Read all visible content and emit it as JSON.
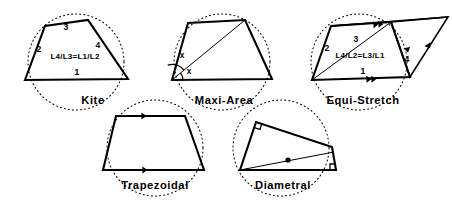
{
  "figure": {
    "background_color": "#ffffff",
    "stroke_color": "#000000",
    "width": 452,
    "height": 223,
    "shape_count": 5
  },
  "shapes": [
    {
      "id": "kite",
      "caption": "Kite",
      "caption_x": 93,
      "caption_y": 104,
      "circle": {
        "cx": 76,
        "cy": 62,
        "r": 48
      },
      "polygon": "25,80 45,26 88,20 128,79",
      "ratio_label": {
        "text": "L4/L3=L1/L2",
        "x": 75,
        "y": 59
      },
      "edge_labels": [
        {
          "text": "1",
          "x": 77,
          "y": 75
        },
        {
          "text": "2",
          "x": 39,
          "y": 52
        },
        {
          "text": "3",
          "x": 66,
          "y": 30
        },
        {
          "text": "4",
          "x": 98,
          "y": 48
        }
      ]
    },
    {
      "id": "maxi-area",
      "caption": "Maxi-Area",
      "caption_x": 224,
      "caption_y": 104,
      "circle": {
        "cx": 222,
        "cy": 62,
        "r": 48
      },
      "polygon": "172,80 188,23 245,20 272,79",
      "diagonal": {
        "x1": 172,
        "y1": 80,
        "x2": 245,
        "y2": 20
      },
      "angle_labels": [
        {
          "text": "x",
          "x": 182,
          "y": 58
        },
        {
          "text": "x",
          "x": 189,
          "y": 74
        }
      ],
      "angle_arcs": [
        {
          "cx": 172,
          "cy": 80,
          "r": 15.5,
          "start_deg": 254,
          "end_deg": 320
        },
        {
          "cx": 172,
          "cy": 80,
          "r": 11.0,
          "start_deg": 320,
          "end_deg": 359
        }
      ]
    },
    {
      "id": "equi-stretch",
      "caption": "Equi-Stretch",
      "caption_x": 363,
      "caption_y": 104,
      "circle": {
        "cx": 359,
        "cy": 62,
        "r": 48
      },
      "polygon": "312,80 331,26 391,22 410,77",
      "extra_polygon": "391,22 448,17 410,77",
      "bridge_line": {
        "x1": 331,
        "y1": 26,
        "x2": 448,
        "y2": 17
      },
      "diagonal": {
        "x1": 312,
        "y1": 80,
        "x2": 391,
        "y2": 22
      },
      "ratio_label": {
        "text": "L4/L2=L3/L1",
        "x": 360,
        "y": 58
      },
      "edge_labels": [
        {
          "text": "1",
          "x": 363,
          "y": 74
        },
        {
          "text": "2",
          "x": 327,
          "y": 51
        },
        {
          "text": "3",
          "x": 356,
          "y": 42
        },
        {
          "text": "4",
          "x": 407,
          "y": 62
        }
      ],
      "double_tick_edges": [
        {
          "x": 378,
          "y": 24.3,
          "angle": -4.4
        },
        {
          "x": 371,
          "y": 79.2,
          "angle": -2.0
        }
      ],
      "single_tick_edges": [
        {
          "x": 408,
          "y": 52,
          "angle": 75
        },
        {
          "x": 430,
          "y": 48,
          "angle": 56
        }
      ]
    },
    {
      "id": "trapezoidal",
      "caption": "Trapezoidal",
      "caption_x": 155,
      "caption_y": 189,
      "circle": {
        "cx": 155,
        "cy": 148,
        "r": 48
      },
      "polygon": "103,170 116,116 185,116 204,170",
      "single_tick_edges": [
        {
          "x": 146,
          "y": 116,
          "angle": 0
        },
        {
          "x": 147,
          "y": 170,
          "angle": 0
        }
      ]
    },
    {
      "id": "diametral",
      "caption": "Diametral",
      "caption_x": 283,
      "caption_y": 189,
      "circle": {
        "cx": 281,
        "cy": 148,
        "r": 48
      },
      "polygon": "240,170 256,122 332,147 336,170",
      "diagonal": {
        "x1": 240,
        "y1": 170,
        "x2": 334,
        "y2": 152
      },
      "center_dot": {
        "cx": 288,
        "cy": 160,
        "r": 2.6
      },
      "right_angle_marks": [
        {
          "x": 256,
          "y": 122,
          "rot": 17
        },
        {
          "x": 336,
          "y": 170,
          "rot": 0
        }
      ]
    }
  ]
}
